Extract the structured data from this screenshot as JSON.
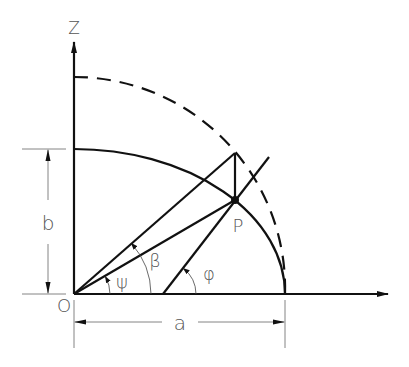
{
  "diagram": {
    "labels": {
      "z_axis": "Z",
      "origin": "O",
      "point": "P",
      "semi_major": "a",
      "semi_minor": "b",
      "geocentric_angle": "ψ",
      "parametric_angle": "β",
      "geodetic_angle": "φ"
    },
    "colors": {
      "line": "#111111",
      "label": "#555555"
    }
  }
}
